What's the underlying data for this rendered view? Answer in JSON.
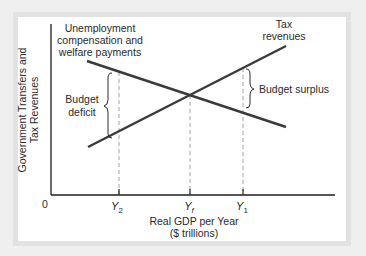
{
  "diagram": {
    "y_axis_label": [
      "Government Transfers and",
      "Tax Revenues"
    ],
    "x_axis_label": [
      "Real GDP per Year",
      "($ trillions)"
    ],
    "origin_label": "0",
    "curves": {
      "transfers": {
        "label": [
          "Unemployment",
          "compensation and",
          "welfare payments"
        ],
        "slope": "downward"
      },
      "taxes": {
        "label": [
          "Tax",
          "revenues"
        ],
        "slope": "upward"
      }
    },
    "x_ticks": [
      {
        "name": "Y",
        "sub": "2"
      },
      {
        "name": "Y",
        "sub": "f"
      },
      {
        "name": "Y",
        "sub": "1"
      }
    ],
    "annotations": {
      "deficit": [
        "Budget",
        "deficit"
      ],
      "surplus": "Budget surplus"
    },
    "colors": {
      "line": "#3a3a3a",
      "axis": "#1e1e1e",
      "dashed": "#8a8a8a",
      "frame": "#e2e2e2"
    }
  }
}
